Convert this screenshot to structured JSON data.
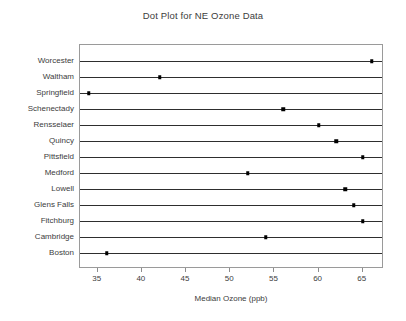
{
  "chart_data": {
    "type": "scatter",
    "title": "Dot Plot for NE Ozone Data",
    "xlabel": "Median Ozone (ppb)",
    "ylabel": "",
    "xlim": [
      33.0,
      67.4
    ],
    "ylim": [
      0,
      14
    ],
    "grid": false,
    "legend": null,
    "orientation": "horizontal",
    "marker": "square",
    "marker_color": "#000000",
    "line_color": "#2e2e2e",
    "frame_color": "#9a9a9a",
    "xticks": [
      35,
      40,
      45,
      50,
      55,
      60,
      65
    ],
    "xtick_labels": [
      "35",
      "40",
      "45",
      "50",
      "55",
      "60",
      "65"
    ],
    "categories": [
      "Worcester",
      "Waltham",
      "Springfield",
      "Schenectady",
      "Rensselaer",
      "Quincy",
      "Pittsfield",
      "Medford",
      "Lowell",
      "Glens Falls",
      "Fitchburg",
      "Cambridge",
      "Boston"
    ],
    "values": [
      66,
      42,
      34,
      56,
      60,
      62,
      65,
      52,
      63,
      64,
      65,
      54,
      36
    ]
  }
}
